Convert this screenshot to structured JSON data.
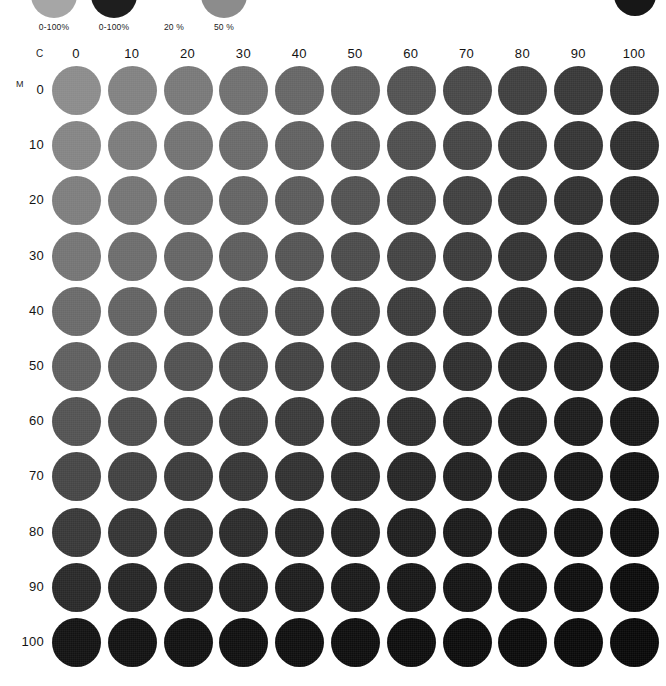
{
  "page": {
    "background": "#ffffff",
    "text_color": "#141414"
  },
  "legend": {
    "items": [
      {
        "label": "0-100%",
        "swatch_color": "#a6a6a6",
        "x": 26
      },
      {
        "label": "0-100%",
        "swatch_color": "#1e1e1e",
        "x": 86
      },
      {
        "label": "20 %",
        "swatch_color": "#ffffff",
        "x": 146
      },
      {
        "label": "50 %",
        "swatch_color": "#8c8c8c",
        "x": 196
      }
    ],
    "corner_swatch_color": "#171717"
  },
  "axes": {
    "column_axis_name": "C",
    "row_axis_name": "M",
    "column_labels": [
      "0",
      "10",
      "20",
      "30",
      "40",
      "50",
      "60",
      "70",
      "80",
      "90",
      "100"
    ],
    "row_labels": [
      "0",
      "10",
      "20",
      "30",
      "40",
      "50",
      "60",
      "70",
      "80",
      "90",
      "100"
    ]
  },
  "chart_data": {
    "type": "heatmap",
    "xlabel": "C",
    "ylabel": "M",
    "grid": false,
    "legend_position": "top",
    "x": [
      0,
      10,
      20,
      30,
      40,
      50,
      60,
      70,
      80,
      90,
      100
    ],
    "y": [
      0,
      10,
      20,
      30,
      40,
      50,
      60,
      70,
      80,
      90,
      100
    ],
    "xlim": [
      0,
      100
    ],
    "ylim": [
      0,
      100
    ],
    "annotations": [
      "0-100%",
      "0-100%",
      "20 %",
      "50 %"
    ],
    "cell_shape": "circle",
    "colors": [
      [
        "#8b8b8b",
        "#818181",
        "#787878",
        "#6f6f6f",
        "#656565",
        "#5c5c5c",
        "#515151",
        "#474747",
        "#3e3e3e",
        "#373737",
        "#313131"
      ],
      [
        "#848484",
        "#7b7b7b",
        "#727272",
        "#696969",
        "#606060",
        "#575757",
        "#4d4d4d",
        "#444444",
        "#3b3b3b",
        "#343434",
        "#2d2d2d"
      ],
      [
        "#7d7d7d",
        "#747474",
        "#6b6b6b",
        "#636363",
        "#5a5a5a",
        "#515151",
        "#484848",
        "#3f3f3f",
        "#373737",
        "#303030",
        "#292929"
      ],
      [
        "#747474",
        "#6c6c6c",
        "#646464",
        "#5c5c5c",
        "#535353",
        "#4a4a4a",
        "#424242",
        "#3a3a3a",
        "#323232",
        "#2b2b2b",
        "#242424"
      ],
      [
        "#696969",
        "#626262",
        "#5a5a5a",
        "#525252",
        "#4a4a4a",
        "#424242",
        "#3a3a3a",
        "#333333",
        "#2c2c2c",
        "#252525",
        "#1f1f1f"
      ],
      [
        "#5e5e5e",
        "#575757",
        "#505050",
        "#494949",
        "#424242",
        "#3b3b3b",
        "#343434",
        "#2d2d2d",
        "#262626",
        "#202020",
        "#1a1a1a"
      ],
      [
        "#525252",
        "#4c4c4c",
        "#464646",
        "#3f3f3f",
        "#393939",
        "#333333",
        "#2d2d2d",
        "#272727",
        "#212121",
        "#1b1b1b",
        "#161616"
      ],
      [
        "#454545",
        "#404040",
        "#3a3a3a",
        "#353535",
        "#303030",
        "#2a2a2a",
        "#252525",
        "#202020",
        "#1b1b1b",
        "#161616",
        "#111111"
      ],
      [
        "#373737",
        "#333333",
        "#2f2f2f",
        "#2a2a2a",
        "#262626",
        "#212121",
        "#1d1d1d",
        "#191919",
        "#151515",
        "#111111",
        "#0d0d0d"
      ],
      [
        "#282828",
        "#252525",
        "#222222",
        "#1f1f1f",
        "#1c1c1c",
        "#191919",
        "#161616",
        "#131313",
        "#101010",
        "#0d0d0d",
        "#0a0a0a"
      ],
      [
        "#121212",
        "#111111",
        "#101010",
        "#0f0f0f",
        "#0e0e0e",
        "#0d0d0d",
        "#0c0c0c",
        "#0b0b0b",
        "#0a0a0a",
        "#090909",
        "#080808"
      ]
    ]
  },
  "layout": {
    "grid_left": 52,
    "grid_top": 22,
    "col_pitch": 55.8,
    "row_pitch": 55.2,
    "dot_size": 49
  }
}
